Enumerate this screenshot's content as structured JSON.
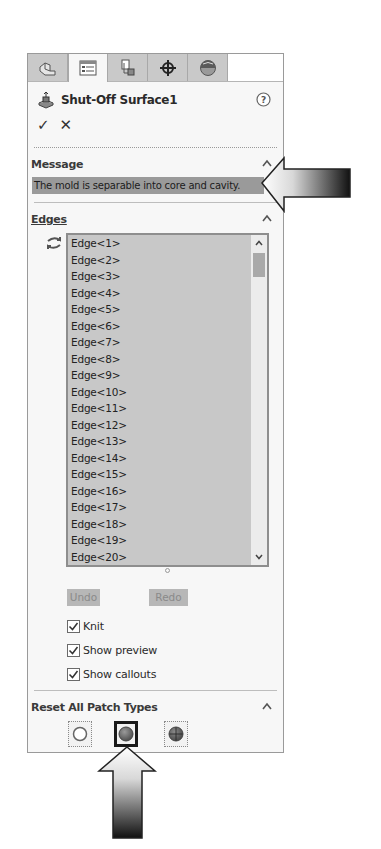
{
  "tabs": [
    {
      "name": "featuremanager",
      "icon": "feature-tree-icon",
      "active": false
    },
    {
      "name": "propertymanager",
      "icon": "property-manager-icon",
      "active": true
    },
    {
      "name": "configurationmanager",
      "icon": "configuration-manager-icon",
      "active": false
    },
    {
      "name": "dimxpertmanager",
      "icon": "crosshair-icon",
      "active": false
    },
    {
      "name": "displaymanager",
      "icon": "appearance-sphere-icon",
      "active": false
    }
  ],
  "header": {
    "title": "Shut-Off Surface1",
    "icon": "shut-off-surface-icon",
    "help_icon": "help-icon",
    "ok_glyph": "✓",
    "cancel_glyph": "✕"
  },
  "message": {
    "title": "Message",
    "text": "The mold is separable into core and cavity."
  },
  "edges": {
    "title": "Edges",
    "items": [
      "Edge<1>",
      "Edge<2>",
      "Edge<3>",
      "Edge<4>",
      "Edge<5>",
      "Edge<6>",
      "Edge<7>",
      "Edge<8>",
      "Edge<9>",
      "Edge<10>",
      "Edge<11>",
      "Edge<12>",
      "Edge<13>",
      "Edge<14>",
      "Edge<15>",
      "Edge<16>",
      "Edge<17>",
      "Edge<18>",
      "Edge<19>",
      "Edge<20>"
    ],
    "undo_label": "Undo",
    "redo_label": "Redo",
    "knit_label": "Knit",
    "knit_checked": true,
    "show_preview_label": "Show preview",
    "show_preview_checked": true,
    "show_callouts_label": "Show callouts",
    "show_callouts_checked": true
  },
  "reset_patch": {
    "title": "Reset All Patch Types",
    "buttons": [
      {
        "name": "no-fill",
        "icon": "empty-circle-icon",
        "selected": false
      },
      {
        "name": "contact",
        "icon": "filled-sphere-icon",
        "selected": true
      },
      {
        "name": "tangent",
        "icon": "tangent-sphere-icon",
        "selected": false
      }
    ]
  },
  "colors": {
    "message_bar": "#9a9a9a",
    "listbox_bg": "#c8c8c8",
    "tab_inactive": "#c9c9c9"
  }
}
